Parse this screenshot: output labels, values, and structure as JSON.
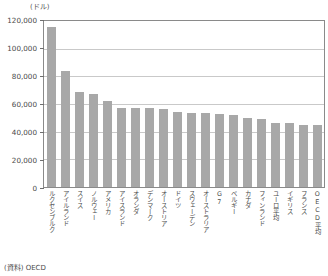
{
  "chart_data": {
    "type": "bar",
    "title": "",
    "unit_label": "(ドル)",
    "xlabel": "",
    "ylabel": "",
    "ylim": [
      0,
      120000
    ],
    "grid": true,
    "legend": false,
    "yticks": [
      0,
      20000,
      40000,
      60000,
      80000,
      100000,
      120000
    ],
    "ytick_labels": [
      "0",
      "20,000",
      "40,000",
      "60,000",
      "80,000",
      "100,000",
      "120,000"
    ],
    "categories": [
      "ルクセンブルク",
      "アイルランド",
      "スイス",
      "ノルウェー",
      "アメリカ",
      "アイスランド",
      "オランダ",
      "デンマーク",
      "オーストリア",
      "ドイツ",
      "スウェーデン",
      "オーストラリア",
      "G7",
      "ベルギー",
      "カナダ",
      "フィンランド",
      "ユーロ平均",
      "イギリス",
      "フランス",
      "OECD平均"
    ],
    "values": [
      116000,
      84000,
      69000,
      67000,
      62000,
      57000,
      57000,
      57000,
      56500,
      54000,
      53500,
      53500,
      53000,
      52000,
      50000,
      49500,
      46500,
      46000,
      45000,
      44500
    ],
    "bar_color": "#a8a8a8",
    "grid_color": "#c9c9c9",
    "frame_color": "#8a8a8a",
    "source_note": "(資料) OECD"
  }
}
